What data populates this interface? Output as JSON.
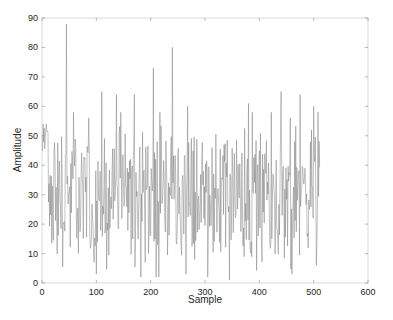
{
  "chart_data": {
    "type": "line",
    "title": "",
    "xlabel": "Sample",
    "ylabel": "Amplitude",
    "xlim": [
      0,
      600
    ],
    "ylim": [
      0,
      90
    ],
    "xticks": [
      0,
      100,
      200,
      300,
      400,
      500,
      600
    ],
    "yticks": [
      0,
      10,
      20,
      30,
      40,
      50,
      60,
      70,
      80,
      90
    ],
    "grid": false,
    "legend": null,
    "line_color": "#808080",
    "n_samples": 512,
    "series": [
      {
        "name": "signal",
        "description": "Noisy amplitude signal, 512 samples, mean ~30, range ~2-88",
        "notable_peaks": [
          {
            "x": 2,
            "y": 54
          },
          {
            "x": 45,
            "y": 88
          },
          {
            "x": 110,
            "y": 65
          },
          {
            "x": 137,
            "y": 64
          },
          {
            "x": 170,
            "y": 64
          },
          {
            "x": 205,
            "y": 73
          },
          {
            "x": 240,
            "y": 80
          },
          {
            "x": 268,
            "y": 60
          },
          {
            "x": 345,
            "y": 75
          },
          {
            "x": 380,
            "y": 61
          },
          {
            "x": 440,
            "y": 65
          },
          {
            "x": 475,
            "y": 64
          },
          {
            "x": 500,
            "y": 60
          }
        ],
        "notable_troughs": [
          {
            "x": 100,
            "y": 3
          },
          {
            "x": 215,
            "y": 2
          },
          {
            "x": 265,
            "y": 3
          },
          {
            "x": 345,
            "y": 1
          },
          {
            "x": 460,
            "y": 3
          },
          {
            "x": 505,
            "y": 6
          }
        ]
      }
    ]
  }
}
